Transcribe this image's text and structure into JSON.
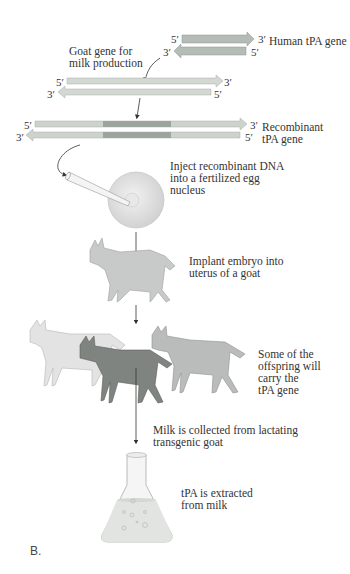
{
  "figure": {
    "caption": "B.",
    "human_gene": {
      "label": "Human tPA gene",
      "top_strand": {
        "left": "5′",
        "right": "3′"
      },
      "bottom_strand": {
        "left": "3′",
        "right": "5′"
      }
    },
    "goat_gene": {
      "label": "Goat gene for\nmilk production",
      "top_strand": {
        "left": "5′",
        "right": "3′"
      },
      "bottom_strand": {
        "left": "3′",
        "right": "5′"
      }
    },
    "recombinant_gene": {
      "label": "Recombinant\ntPA gene",
      "top_strand": {
        "left": "5′",
        "right": "3′"
      },
      "bottom_strand": {
        "left": "3′",
        "right": "5′"
      }
    },
    "steps": [
      {
        "id": "inject",
        "text": "Inject recombinant DNA\ninto a fertilized egg\nnucleus"
      },
      {
        "id": "implant",
        "text": "Implant embryo into\nuterus of a goat"
      },
      {
        "id": "offspring",
        "text": "Some of the\noffspring will\ncarry the\ntPA gene"
      },
      {
        "id": "milk",
        "text": "Milk is collected from lactating\ntransgenic goat"
      },
      {
        "id": "extract",
        "text": "tPA is extracted\nfrom milk"
      }
    ],
    "colors": {
      "dna_light": "#c9cfc9",
      "dna_insert": "#9aa29c",
      "goat_light": "#d9dbd9",
      "goat_mid": "#b7b9b7",
      "goat_dark": "#7f8380",
      "egg": "#dedede"
    }
  }
}
